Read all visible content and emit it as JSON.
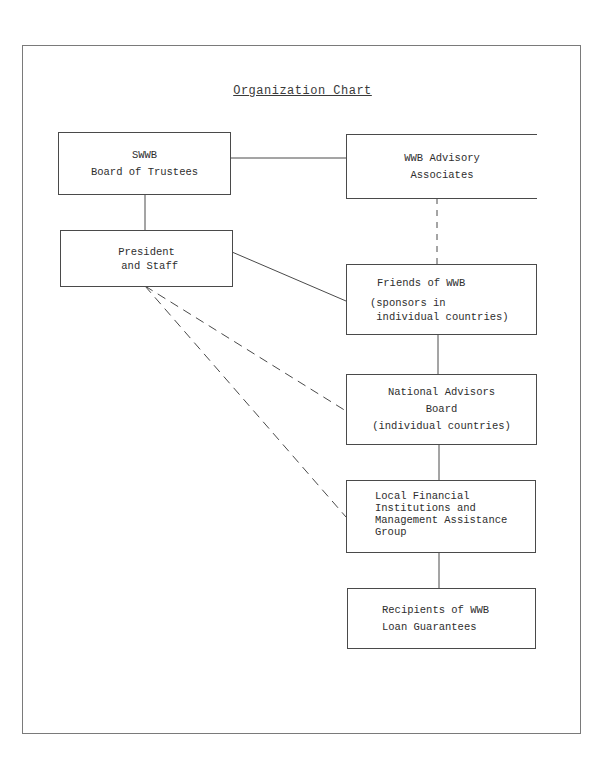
{
  "title": "Organization Chart",
  "nodes": {
    "board": {
      "lines": [
        "SWWB",
        "Board of Trustees"
      ]
    },
    "advisory": {
      "lines": [
        "WWB Advisory",
        "Associates"
      ]
    },
    "president": {
      "lines": [
        "President",
        " and Staff"
      ]
    },
    "friends": {
      "lines": [
        "Friends of WWB",
        "(sponsors in",
        " individual countries)"
      ]
    },
    "national": {
      "lines": [
        "National Advisors",
        "Board",
        "(individual countries)"
      ]
    },
    "local": {
      "lines": [
        "Local Financial",
        "Institutions and",
        "Management Assistance",
        "Group"
      ]
    },
    "recipients": {
      "lines": [
        "Recipients of WWB",
        "Loan Guarantees"
      ]
    }
  },
  "connections": [
    {
      "from": "board",
      "to": "advisory",
      "style": "solid"
    },
    {
      "from": "board",
      "to": "president",
      "style": "solid"
    },
    {
      "from": "advisory",
      "to": "friends",
      "style": "dashed"
    },
    {
      "from": "president",
      "to": "friends",
      "style": "solid"
    },
    {
      "from": "president",
      "to": "national",
      "style": "dashed"
    },
    {
      "from": "president",
      "to": "local",
      "style": "dashed"
    },
    {
      "from": "friends",
      "to": "national",
      "style": "solid"
    },
    {
      "from": "national",
      "to": "local",
      "style": "solid"
    },
    {
      "from": "local",
      "to": "recipients",
      "style": "solid"
    }
  ],
  "colors": {
    "ink": "#333333",
    "frame": "#7a7a7a",
    "paper": "#ffffff"
  }
}
